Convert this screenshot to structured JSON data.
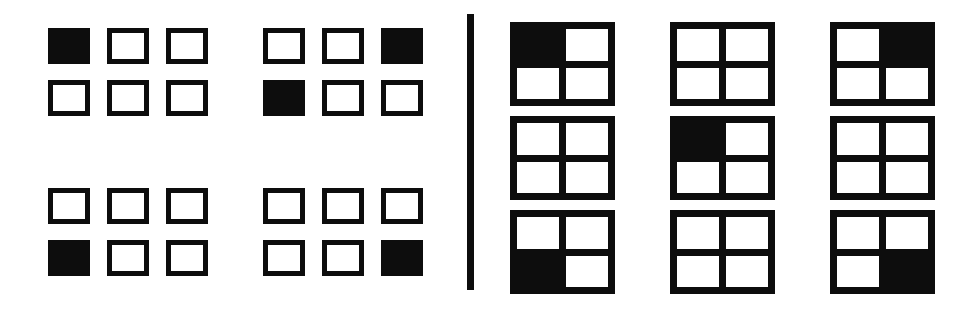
{
  "figure": {
    "background_color": "#ffffff",
    "ink_color": "#0d0d0d",
    "width": 966,
    "height": 314
  },
  "divider": {
    "orientation": "vertical",
    "color": "#0d0d0d"
  },
  "left_panel": {
    "label": "separated-squares-panel",
    "group_rows": 2,
    "group_cols": 2,
    "squares_per_group_rows": 2,
    "squares_per_group_cols": 3,
    "groups": [
      {
        "name": "group-top-left",
        "position": "top-left",
        "cells": [
          [
            1,
            0,
            0
          ],
          [
            0,
            0,
            0
          ]
        ]
      },
      {
        "name": "group-top-right",
        "position": "top-right",
        "cells": [
          [
            0,
            0,
            1
          ],
          [
            1,
            0,
            0
          ]
        ]
      },
      {
        "name": "group-bottom-left",
        "position": "bottom-left",
        "cells": [
          [
            0,
            0,
            0
          ],
          [
            1,
            0,
            0
          ]
        ]
      },
      {
        "name": "group-bottom-right",
        "position": "bottom-right",
        "cells": [
          [
            0,
            0,
            0
          ],
          [
            0,
            0,
            1
          ]
        ]
      }
    ]
  },
  "right_panel": {
    "label": "quad-grid-panel",
    "matrix_rows": 3,
    "matrix_cols": 3,
    "quads": [
      {
        "name": "quad-r1c1",
        "row": 1,
        "col": 1,
        "cells": [
          [
            1,
            0
          ],
          [
            0,
            0
          ]
        ]
      },
      {
        "name": "quad-r1c2",
        "row": 1,
        "col": 2,
        "cells": [
          [
            0,
            0
          ],
          [
            0,
            0
          ]
        ]
      },
      {
        "name": "quad-r1c3",
        "row": 1,
        "col": 3,
        "cells": [
          [
            0,
            1
          ],
          [
            0,
            0
          ]
        ]
      },
      {
        "name": "quad-r2c1",
        "row": 2,
        "col": 1,
        "cells": [
          [
            0,
            0
          ],
          [
            0,
            0
          ]
        ]
      },
      {
        "name": "quad-r2c2",
        "row": 2,
        "col": 2,
        "cells": [
          [
            1,
            0
          ],
          [
            0,
            0
          ]
        ]
      },
      {
        "name": "quad-r2c3",
        "row": 2,
        "col": 3,
        "cells": [
          [
            0,
            0
          ],
          [
            0,
            0
          ]
        ]
      },
      {
        "name": "quad-r3c1",
        "row": 3,
        "col": 1,
        "cells": [
          [
            0,
            0
          ],
          [
            1,
            0
          ]
        ]
      },
      {
        "name": "quad-r3c2",
        "row": 3,
        "col": 2,
        "cells": [
          [
            0,
            0
          ],
          [
            0,
            0
          ]
        ]
      },
      {
        "name": "quad-r3c3",
        "row": 3,
        "col": 3,
        "cells": [
          [
            0,
            0
          ],
          [
            0,
            1
          ]
        ]
      }
    ]
  }
}
